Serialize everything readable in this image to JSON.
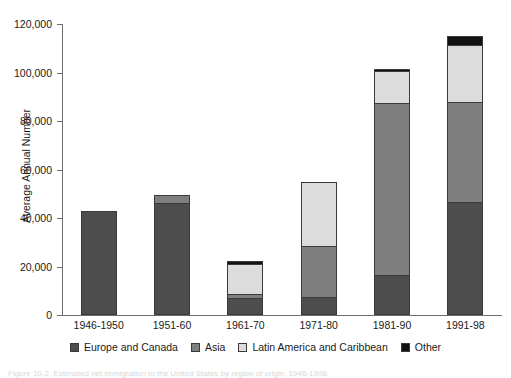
{
  "chart_data": {
    "type": "bar",
    "subtype": "stacked-bar",
    "title": "",
    "xlabel": "",
    "ylabel": "Average Annual Number",
    "ylim": [
      0,
      120000
    ],
    "ytick_values": [
      0,
      20000,
      40000,
      60000,
      80000,
      100000,
      120000
    ],
    "ytick_labels": [
      "0",
      "20,000",
      "40,000",
      "60,000",
      "80,000",
      "100,000",
      "120,000"
    ],
    "grid": false,
    "legend_position": "bottom",
    "categories": [
      "1946-1950",
      "1951-60",
      "1961-70",
      "1971-80",
      "1981-90",
      "1991-98"
    ],
    "series": [
      {
        "name": "Europe and Canada",
        "color": "#4d4d4d",
        "values": [
          42500,
          45800,
          6700,
          7200,
          16000,
          46300
        ]
      },
      {
        "name": "Asia",
        "color": "#7f7f7f",
        "values": [
          0,
          3200,
          1700,
          20800,
          71000,
          41000
        ]
      },
      {
        "name": "Latin America and Caribbean",
        "color": "#dcdcdc",
        "values": [
          0,
          0,
          12200,
          26400,
          13200,
          23700
        ]
      },
      {
        "name": "Other",
        "color": "#111111",
        "values": [
          0,
          0,
          1200,
          0,
          900,
          3500
        ]
      }
    ],
    "totals": [
      42500,
      49000,
      21800,
      54400,
      101100,
      114500
    ]
  },
  "axis": {
    "y_title": "Average Annual Number"
  },
  "legend": {
    "items": [
      {
        "label": "Europe and Canada",
        "color": "#4d4d4d"
      },
      {
        "label": "Asia",
        "color": "#7f7f7f"
      },
      {
        "label": "Latin America and Caribbean",
        "color": "#dcdcdc"
      },
      {
        "label": "Other",
        "color": "#111111"
      }
    ]
  },
  "caption": {
    "text": "Figure 10-2. Estimated net immigration to the United States by region of origin, 1946-1998."
  }
}
